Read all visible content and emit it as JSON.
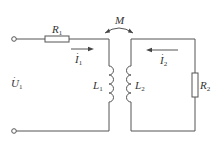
{
  "diagram": {
    "type": "coupled-inductor circuit",
    "stroke_color": "#555555",
    "labels": {
      "R1": {
        "base": "R",
        "sub": "1"
      },
      "R2": {
        "base": "R",
        "sub": "2"
      },
      "L1": {
        "base": "L",
        "sub": "1"
      },
      "L2": {
        "base": "L",
        "sub": "2"
      },
      "M": "M",
      "U1": {
        "base": "U",
        "sub": "1",
        "accent": "·"
      },
      "I1": {
        "base": "I",
        "sub": "1",
        "accent": "·"
      },
      "I2": {
        "base": "I",
        "sub": "2",
        "accent": "·"
      }
    },
    "components": [
      {
        "id": "R1",
        "kind": "resistor",
        "orientation": "horizontal"
      },
      {
        "id": "L1",
        "kind": "inductor",
        "orientation": "vertical"
      },
      {
        "id": "L2",
        "kind": "inductor",
        "orientation": "vertical"
      },
      {
        "id": "M",
        "kind": "mutual-inductance",
        "between": [
          "L1",
          "L2"
        ]
      },
      {
        "id": "R2",
        "kind": "resistor",
        "orientation": "vertical"
      }
    ],
    "currents": [
      {
        "id": "I1",
        "direction": "right",
        "loop": "primary"
      },
      {
        "id": "I2",
        "direction": "left",
        "loop": "secondary"
      }
    ],
    "terminals": 2
  }
}
